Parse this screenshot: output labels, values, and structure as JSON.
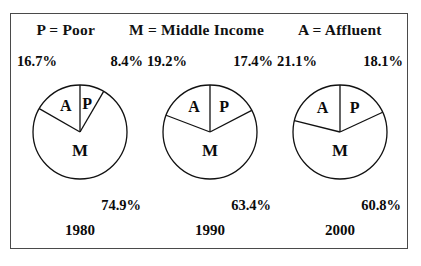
{
  "legend": {
    "entries": [
      {
        "label": "P = Poor"
      },
      {
        "label": "M = Middle Income"
      },
      {
        "label": "A = Affluent"
      }
    ]
  },
  "chart_data": {
    "type": "pie",
    "title": "P = Poor    M = Middle Income    A = Affluent",
    "xlabel": "",
    "ylabel": "",
    "legend_position": "top",
    "grid": false,
    "categories": [
      "P",
      "M",
      "A"
    ],
    "category_names": [
      "Poor",
      "Middle Income",
      "Affluent"
    ],
    "charts": [
      {
        "year": "1980",
        "slices": [
          {
            "key": "P",
            "letter": "P",
            "value": 8.4,
            "label": "8.4%"
          },
          {
            "key": "M",
            "letter": "M",
            "value": 74.9,
            "label": "74.9%"
          },
          {
            "key": "A",
            "letter": "A",
            "value": 16.7,
            "label": "16.7%"
          }
        ]
      },
      {
        "year": "1990",
        "slices": [
          {
            "key": "P",
            "letter": "P",
            "value": 17.4,
            "label": "17.4%"
          },
          {
            "key": "M",
            "letter": "M",
            "value": 63.4,
            "label": "63.4%"
          },
          {
            "key": "A",
            "letter": "A",
            "value": 19.2,
            "label": "19.2%"
          }
        ]
      },
      {
        "year": "2000",
        "slices": [
          {
            "key": "P",
            "letter": "P",
            "value": 18.1,
            "label": "18.1%"
          },
          {
            "key": "M",
            "letter": "M",
            "value": 60.8,
            "label": "60.8%"
          },
          {
            "key": "A",
            "letter": "A",
            "value": 21.1,
            "label": "21.1%"
          }
        ]
      }
    ]
  },
  "colors": {
    "frame_border": "#4a4a4a",
    "slice_outline": "#111111",
    "slice_fill": "#ffffff",
    "text": "#0b0b0b",
    "background": "#ffffff"
  },
  "years": [
    {
      "label": "1980"
    },
    {
      "label": "1990"
    },
    {
      "label": "2000"
    }
  ]
}
